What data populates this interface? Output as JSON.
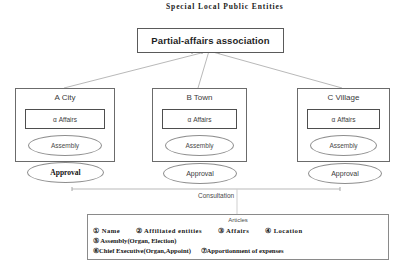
{
  "diagram": {
    "top_caption": "Special  Local  Public Entities",
    "association": {
      "label": "Partial-affairs association"
    },
    "municipalities": [
      {
        "name": "A City",
        "affairs_label": "α Affairs",
        "assembly_label": "Assembly",
        "approval_label": "Approval"
      },
      {
        "name": "B Town",
        "affairs_label": "α Affairs",
        "assembly_label": "Assembly",
        "approval_label": "Approval"
      },
      {
        "name": "C Village",
        "affairs_label": "α Affairs",
        "assembly_label": "Assembly",
        "approval_label": "Approval"
      }
    ],
    "consultation_label": "Consultation",
    "articles": {
      "title": "Articles",
      "lines": [
        [
          "① Name",
          "② Affiliated  entities",
          "③ Affairs",
          "④ Location"
        ],
        [
          "⑤ Assembly(Organ, Election)"
        ],
        [
          "⑥Chief Executive(Organ,Appoint)",
          "⑦Apportionment of expenses"
        ]
      ]
    },
    "colors": {
      "background": "#ffffff",
      "line": "#9a9a9a",
      "box_border": "#6b6b6b",
      "text": "#2b2b2b"
    }
  }
}
